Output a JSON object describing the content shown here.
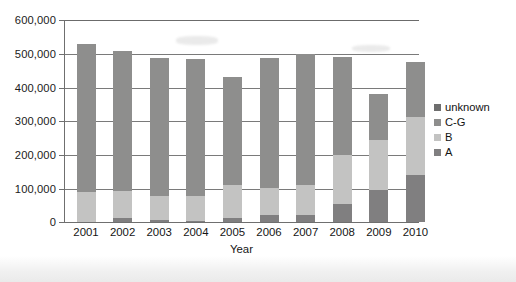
{
  "chart_data": {
    "type": "bar",
    "stacked": true,
    "title": "",
    "xlabel": "Year",
    "ylabel": "",
    "categories": [
      "2001",
      "2002",
      "2003",
      "2004",
      "2005",
      "2006",
      "2007",
      "2008",
      "2009",
      "2010"
    ],
    "ylim": [
      0,
      600000
    ],
    "ytick_labels": [
      "600,000",
      "500,000",
      "400,000",
      "300,000",
      "200,000",
      "100,000",
      "0"
    ],
    "ytick_values": [
      600000,
      500000,
      400000,
      300000,
      200000,
      100000,
      0
    ],
    "grid": true,
    "legend_position": "right",
    "series": [
      {
        "name": "A",
        "color": "#807f80",
        "values": [
          0,
          12000,
          6000,
          3000,
          13000,
          21000,
          22000,
          53000,
          94000,
          140000
        ]
      },
      {
        "name": "B",
        "color": "#c3c3c2",
        "values": [
          90000,
          81000,
          71000,
          74000,
          98000,
          79000,
          88000,
          146000,
          151000,
          171000
        ]
      },
      {
        "name": "C-G",
        "color": "#8e8e8d",
        "values": [
          438000,
          414000,
          410000,
          406000,
          319000,
          386000,
          390000,
          291000,
          136000,
          165000
        ]
      },
      {
        "name": "unknown",
        "color": "#6e6e6e",
        "values": [
          0,
          0,
          0,
          0,
          0,
          0,
          0,
          0,
          0,
          0
        ]
      }
    ],
    "totals": [
      528000,
      507000,
      487000,
      483000,
      430000,
      486000,
      500000,
      490000,
      381000,
      476000
    ]
  },
  "legend": {
    "items": [
      {
        "label": "unknown",
        "color": "#6e6e6e"
      },
      {
        "label": "C-G",
        "color": "#8e8e8d"
      },
      {
        "label": "B",
        "color": "#c3c3c2"
      },
      {
        "label": "A",
        "color": "#807f80"
      }
    ]
  },
  "axes": {
    "x_title": "Year"
  }
}
